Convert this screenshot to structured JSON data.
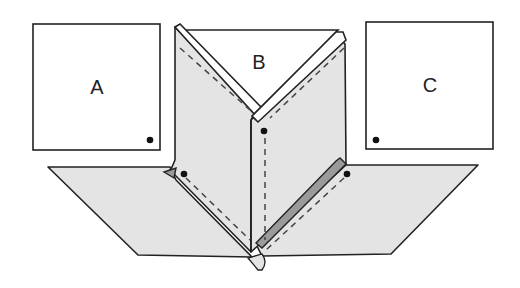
{
  "diagram": {
    "type": "paper-folding-step",
    "panels": [
      {
        "id": "A",
        "label": "A",
        "dot_position": "bottom-right"
      },
      {
        "id": "B",
        "label": "B",
        "dot_position": "none"
      },
      {
        "id": "C",
        "label": "C",
        "dot_position": "bottom-left"
      }
    ],
    "center_figure": {
      "description": "Folded paper with two vertical flaps forming a V opening at top labeled B, dashed fold lines, and a base sheet extending as parallelograms to left and right",
      "dots": 4
    },
    "colors": {
      "paper": "#e4e4e4",
      "edge": "#9a9a9a",
      "stroke": "#222222",
      "background": "#ffffff"
    }
  }
}
